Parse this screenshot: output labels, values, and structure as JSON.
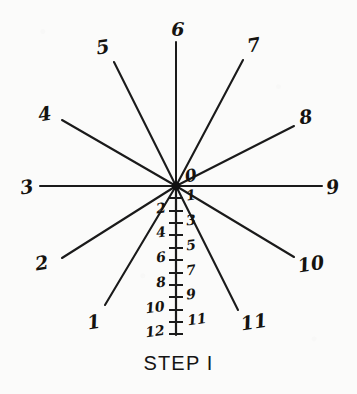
{
  "figure": {
    "caption": "STEP I",
    "origin_label": "0",
    "ink_color": "#15130f",
    "paper_color": "#fbfbfa"
  },
  "chart_data": {
    "type": "scatter",
    "title": "STEP I",
    "subtitle": "",
    "xlabel": "",
    "ylabel": "",
    "origin": {
      "x": 176,
      "y": 186
    },
    "rays": [
      {
        "label": "1",
        "tip_x": 105,
        "tip_y": 305,
        "label_x": 94,
        "label_y": 322,
        "angle_deg": 239
      },
      {
        "label": "2",
        "tip_x": 62,
        "tip_y": 258,
        "label_x": 42,
        "label_y": 263,
        "angle_deg": 214
      },
      {
        "label": "3",
        "tip_x": 40,
        "tip_y": 186,
        "label_x": 27,
        "label_y": 187,
        "angle_deg": 180
      },
      {
        "label": "4",
        "tip_x": 62,
        "tip_y": 120,
        "label_x": 45,
        "label_y": 114,
        "angle_deg": 151
      },
      {
        "label": "5",
        "tip_x": 114,
        "tip_y": 62,
        "label_x": 103,
        "label_y": 47,
        "angle_deg": 119
      },
      {
        "label": "6",
        "tip_x": 176,
        "tip_y": 42,
        "label_x": 178,
        "label_y": 29,
        "angle_deg": 90
      },
      {
        "label": "7",
        "tip_x": 243,
        "tip_y": 60,
        "label_x": 254,
        "label_y": 45,
        "angle_deg": 62
      },
      {
        "label": "8",
        "tip_x": 294,
        "tip_y": 126,
        "label_x": 306,
        "label_y": 117,
        "angle_deg": 35
      },
      {
        "label": "9",
        "tip_x": 322,
        "tip_y": 186,
        "label_x": 333,
        "label_y": 187,
        "angle_deg": 0
      },
      {
        "label": "10",
        "tip_x": 294,
        "tip_y": 257,
        "label_x": 311,
        "label_y": 264,
        "angle_deg": 333
      },
      {
        "label": "11",
        "tip_x": 238,
        "tip_y": 310,
        "label_x": 254,
        "label_y": 322,
        "angle_deg": 304
      }
    ],
    "scale": {
      "axis_x": 176,
      "top_y": 186,
      "bottom_y": 335,
      "tick_count": 12,
      "tick_spacing_px": 12.3,
      "tick_half_width": 7,
      "left_labels": [
        "2",
        "4",
        "6",
        "8",
        "10",
        "12"
      ],
      "right_labels": [
        "1",
        "3",
        "5",
        "7",
        "9",
        "11"
      ],
      "ticks": [
        {
          "value": "1",
          "y": 198,
          "side": "right"
        },
        {
          "value": "2",
          "y": 211,
          "side": "left"
        },
        {
          "value": "3",
          "y": 223,
          "side": "right"
        },
        {
          "value": "4",
          "y": 235,
          "side": "left"
        },
        {
          "value": "5",
          "y": 248,
          "side": "right"
        },
        {
          "value": "6",
          "y": 260,
          "side": "left"
        },
        {
          "value": "7",
          "y": 273,
          "side": "right"
        },
        {
          "value": "8",
          "y": 285,
          "side": "left"
        },
        {
          "value": "9",
          "y": 297,
          "side": "right"
        },
        {
          "value": "10",
          "y": 310,
          "side": "left"
        },
        {
          "value": "11",
          "y": 322,
          "side": "right"
        },
        {
          "value": "12",
          "y": 334,
          "side": "left"
        }
      ]
    },
    "grid": false,
    "legend": "none"
  }
}
